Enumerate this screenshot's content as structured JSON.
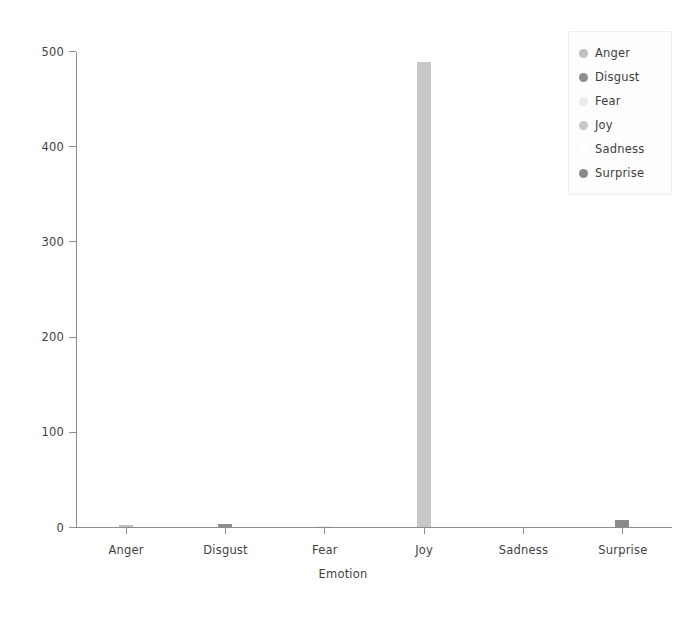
{
  "chart_data": {
    "type": "bar",
    "title": "",
    "xlabel": "Emotion",
    "ylabel": "Frequency",
    "categories": [
      "Anger",
      "Disgust",
      "Fear",
      "Joy",
      "Sadness",
      "Surprise"
    ],
    "values": [
      2,
      3,
      1,
      488,
      0,
      7
    ],
    "ylim": [
      0,
      500
    ],
    "yticks": [
      0,
      100,
      200,
      300,
      400,
      500
    ],
    "ytick_labels": [
      "0",
      "100",
      "200",
      "300",
      "400",
      "500"
    ],
    "grid": false,
    "legend": {
      "position": "upper right",
      "entries": [
        {
          "label": "Anger",
          "color": "#c0c0c0"
        },
        {
          "label": "Disgust",
          "color": "#8e8e8e"
        },
        {
          "label": "Fear",
          "color": "#ebebeb"
        },
        {
          "label": "Joy",
          "color": "#c8c8c8"
        },
        {
          "label": "Sadness",
          "color": "#ffffff"
        },
        {
          "label": "Surprise",
          "color": "#8a8a8a"
        }
      ]
    },
    "bar_colors": [
      "#c0c0c0",
      "#8e8e8e",
      "#ebebeb",
      "#c8c8c8",
      "#ffffff",
      "#8a8a8a"
    ]
  }
}
